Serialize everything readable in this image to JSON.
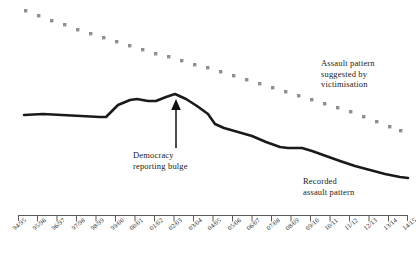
{
  "chart_data": {
    "type": "line",
    "title": "",
    "subtitle": "",
    "xlabel": "",
    "ylabel": "",
    "grid": false,
    "legend_position": "inline-annotations",
    "categories": [
      "94/95",
      "95/96",
      "96/97",
      "97/98",
      "98/99",
      "99/00",
      "00/01",
      "01/02",
      "02/03",
      "03/04",
      "04/05",
      "05/06",
      "06/07",
      "07/08",
      "08/09",
      "09/10",
      "10/11",
      "11/12",
      "12/13",
      "13/14",
      "14/15"
    ],
    "ylim": [
      0,
      100
    ],
    "y_axis_visible": false,
    "series": [
      {
        "name": "Recorded assault pattern",
        "style": "solid",
        "color": "#1a1a1a",
        "values": [
          52,
          52,
          51,
          50,
          49,
          56,
          60,
          58,
          62,
          57,
          50,
          40,
          36,
          33,
          30,
          30,
          27,
          24,
          22,
          20,
          19
        ]
      },
      {
        "name": "Assault pattern suggested by victimisation",
        "style": "dotted",
        "color": "#8c8c8c",
        "values": [
          96,
          94,
          92,
          90,
          88,
          86,
          83,
          81,
          79,
          77,
          74,
          72,
          69,
          66,
          63,
          60,
          57,
          54,
          51,
          48,
          45
        ]
      }
    ],
    "annotations": [
      {
        "id": "victimisation",
        "text": "Assault pattern\nsuggested by\nvictimisation",
        "target_series": "Assault pattern suggested by victimisation"
      },
      {
        "id": "recorded",
        "text": "Recorded\nassault pattern",
        "target_series": "Recorded assault pattern"
      },
      {
        "id": "bulge",
        "text": "Democracy\nreporting bulge",
        "target_series": "Recorded assault pattern",
        "marker": "up-arrow",
        "target_category": "02/03"
      }
    ]
  }
}
